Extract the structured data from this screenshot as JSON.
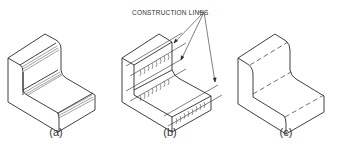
{
  "figure": {
    "panels": [
      {
        "id": "a",
        "caption": "(a)",
        "style": "shaded rounds with hatch lines"
      },
      {
        "id": "b",
        "caption": "(b)",
        "style": "construction lines with arc tick marks"
      },
      {
        "id": "c",
        "caption": "(c)",
        "style": "dashed tangent lines"
      }
    ],
    "annotation": {
      "label": "CONSTRUCTION LINES",
      "arrow_count": 3
    },
    "colors": {
      "line": "#2a2a2a",
      "background": "#ffffff",
      "text": "#333333"
    }
  }
}
